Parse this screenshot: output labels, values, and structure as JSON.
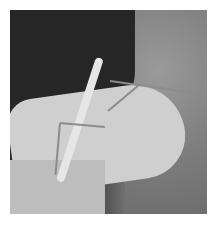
{
  "image": {
    "description": "Grayscale photo of a praying mantis perched on an open human hand, dark clothing behind, blurred grass background",
    "subject": "praying mantis",
    "colors": {
      "border": "#ffffff",
      "shirt": "#262626",
      "hand": "#cfcfcf",
      "background": "#7c7c7c"
    }
  }
}
